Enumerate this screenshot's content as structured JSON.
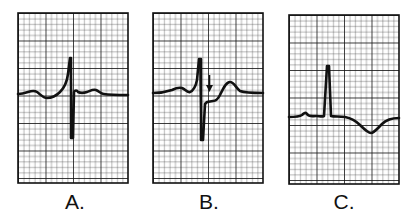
{
  "figure": {
    "type": "ECG strip comparison",
    "grid": {
      "small_cell_px": 5.5,
      "major_every": 5,
      "minor_color": "#555555",
      "major_color": "#111111",
      "background": "#ffffff"
    },
    "trace_color": "#111111",
    "panels": [
      {
        "id": "A",
        "label": "A.",
        "description": "Normal ECG complex with tall R wave, deep S wave, isoelectric ST segment and upright T wave",
        "box": {
          "x": 18,
          "y": 13,
          "w": 110,
          "h": 170
        },
        "label_x": 75
      },
      {
        "id": "B",
        "label": "B.",
        "description": "ECG complex with ST segment depression indicated by downward arrow",
        "box": {
          "x": 153,
          "y": 13,
          "w": 110,
          "h": 170
        },
        "label_x": 209,
        "annotation": {
          "type": "arrow-down",
          "x": 209,
          "y1": 75,
          "y2": 92
        }
      },
      {
        "id": "C",
        "label": "C.",
        "description": "ECG complex with narrow R wave and inverted T wave",
        "box": {
          "x": 289,
          "y": 15,
          "w": 110,
          "h": 169
        },
        "label_x": 344
      }
    ]
  }
}
